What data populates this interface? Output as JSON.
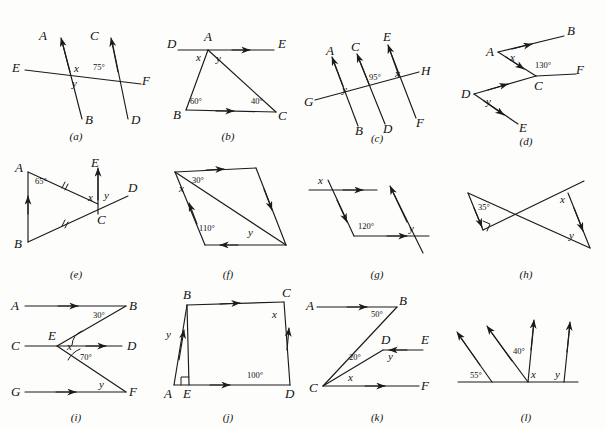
{
  "figure": {
    "kind": "geometry-exercise-plate",
    "panel_count": 12,
    "captions": [
      "(a)",
      "(b)",
      "(c)",
      "(d)",
      "(e)",
      "(f)",
      "(g)",
      "(h)",
      "(i)",
      "(j)",
      "(k)",
      "(l)"
    ],
    "ink_color": "#1b1b1b",
    "paper_color": "#fdfdfc"
  },
  "panels": {
    "a": {
      "caption": "(a)",
      "points": [
        "A",
        "B",
        "C",
        "D",
        "E",
        "F"
      ],
      "labels": {
        "A": "A",
        "B": "B",
        "C": "C",
        "D": "D",
        "E": "E",
        "F": "F",
        "x": "x",
        "y": "y",
        "angle": "75°"
      },
      "description": "Two parallel transversals AB and CD cut by line EF"
    },
    "b": {
      "caption": "(b)",
      "points": [
        "A",
        "B",
        "C",
        "D",
        "E"
      ],
      "labels": {
        "A": "A",
        "B": "B",
        "C": "C",
        "D": "D",
        "E": "E",
        "x": "x",
        "y": "y",
        "angleB": "60°",
        "angleC": "40°"
      },
      "description": "Triangle ABC with line DE parallel to BC through A"
    },
    "c": {
      "caption": "(c)",
      "points": [
        "A",
        "B",
        "C",
        "D",
        "E",
        "F",
        "G",
        "H"
      ],
      "labels": {
        "A": "A",
        "B": "B",
        "C": "C",
        "D": "D",
        "E": "E",
        "F": "F",
        "G": "G",
        "H": "H",
        "x": "x",
        "y": "y",
        "angle": "95°"
      },
      "description": "Three parallel lines AB, CD, EF cut by transversal GH"
    },
    "d": {
      "caption": "(d)",
      "points": [
        "A",
        "B",
        "C",
        "D",
        "E",
        "F"
      ],
      "labels": {
        "A": "A",
        "B": "B",
        "C": "C",
        "D": "D",
        "E": "E",
        "F": "F",
        "x": "x",
        "y": "y",
        "angle": "130°"
      },
      "description": "Zigzag AB, AC, CF with DE below, arrows marking parallels"
    },
    "e": {
      "caption": "(e)",
      "points": [
        "A",
        "B",
        "C",
        "D",
        "E"
      ],
      "labels": {
        "A": "A",
        "B": "B",
        "C": "C",
        "D": "D",
        "E": "E",
        "x": "x",
        "y": "y",
        "angle": "65°"
      },
      "description": "Isosceles triangle ABC with AB parallel to CE and line BD through C"
    },
    "f": {
      "caption": "(f)",
      "labels": {
        "x": "x",
        "y": "y",
        "angle1": "30°",
        "angle2": "110°"
      },
      "description": "Parallelogram with a diagonal drawn"
    },
    "g": {
      "caption": "(g)",
      "labels": {
        "x": "x",
        "y": "y",
        "angle": "120°"
      },
      "description": "Two parallel horizontal rays joined by a zigzag, plus a transversal"
    },
    "h": {
      "caption": "(h)",
      "labels": {
        "x": "x",
        "y": "y",
        "angle": "35°",
        "right_angle": "90°"
      },
      "description": "Two crossing lines forming a bowtie of triangles; left triangle has a right angle"
    },
    "i": {
      "caption": "(i)",
      "points": [
        "A",
        "B",
        "C",
        "D",
        "E",
        "F",
        "G"
      ],
      "labels": {
        "A": "A",
        "B": "B",
        "C": "C",
        "D": "D",
        "E": "E",
        "F": "F",
        "G": "G",
        "x": "x",
        "y": "y",
        "angle1": "30°",
        "angle2": "70°"
      },
      "description": "Three parallel horizontal rays AB, CD, GF with zigzag B-E-F"
    },
    "j": {
      "caption": "(j)",
      "points": [
        "A",
        "B",
        "C",
        "D",
        "E"
      ],
      "labels": {
        "A": "A",
        "B": "B",
        "C": "C",
        "D": "D",
        "E": "E",
        "x": "x",
        "y": "y",
        "angle": "100°",
        "right_angle": "90°"
      },
      "description": "Parallelogram ABCD with altitude BE to base AD"
    },
    "k": {
      "caption": "(k)",
      "points": [
        "A",
        "B",
        "C",
        "D",
        "E",
        "F"
      ],
      "labels": {
        "A": "A",
        "B": "B",
        "C": "C",
        "D": "D",
        "E": "E",
        "F": "F",
        "x": "x",
        "y": "y",
        "angle1": "50°",
        "angle2": "20°"
      },
      "description": "Rays AB, DE, CF parallel; segments CB and CD from vertex C"
    },
    "l": {
      "caption": "(l)",
      "labels": {
        "x": "x",
        "y": "y",
        "angle1": "55°",
        "angle2": "40°"
      },
      "description": "Four parallel rays rising from a horizontal base line"
    }
  }
}
